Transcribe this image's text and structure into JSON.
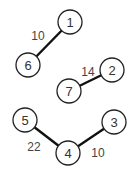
{
  "graph": {
    "nodes": [
      {
        "id": "1",
        "label": "1",
        "x": 70,
        "y": 22
      },
      {
        "id": "6",
        "label": "6",
        "x": 28,
        "y": 65
      },
      {
        "id": "2",
        "label": "2",
        "x": 112,
        "y": 70
      },
      {
        "id": "7",
        "label": "7",
        "x": 69,
        "y": 91
      },
      {
        "id": "5",
        "label": "5",
        "x": 25,
        "y": 120
      },
      {
        "id": "3",
        "label": "3",
        "x": 114,
        "y": 122
      },
      {
        "id": "4",
        "label": "4",
        "x": 68,
        "y": 153
      }
    ],
    "edges": [
      {
        "from": "1",
        "to": "6",
        "weight": "10",
        "lx": 38,
        "ly": 36
      },
      {
        "from": "2",
        "to": "7",
        "weight": "14",
        "lx": 88,
        "ly": 72
      },
      {
        "from": "5",
        "to": "4",
        "weight": "22",
        "lx": 34,
        "ly": 147
      },
      {
        "from": "4",
        "to": "3",
        "weight": "10",
        "lx": 98,
        "ly": 153
      }
    ]
  }
}
